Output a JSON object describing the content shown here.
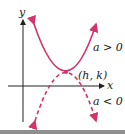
{
  "figure": {
    "type": "diagram",
    "axes": {
      "x_label": "x",
      "y_label": "y"
    },
    "vertex_label": "(h, k)",
    "curves": [
      {
        "name": "upward-parabola",
        "label": "a > 0",
        "style": "solid",
        "opens": "up"
      },
      {
        "name": "downward-parabola",
        "label": "a < 0",
        "style": "dashed",
        "opens": "down"
      }
    ],
    "colors": {
      "curve": "#d6336c",
      "axis": "#222222",
      "text": "#222222",
      "bottom_strip": "#8f8f8f"
    }
  }
}
